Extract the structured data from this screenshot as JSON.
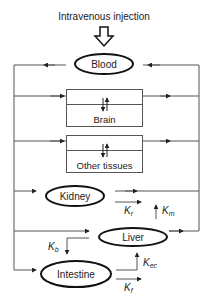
{
  "title": "Intravenous injection",
  "compartments": {
    "blood": "Blood",
    "brain": "Brain",
    "other_tissues": "Other tissues",
    "kidney": "Kidney",
    "liver": "Liver",
    "intestine": "Intestine"
  },
  "rate_constants": {
    "kr": {
      "base": "K",
      "sub": "r"
    },
    "km": {
      "base": "K",
      "sub": "m"
    },
    "kb": {
      "base": "K",
      "sub": "b"
    },
    "kec": {
      "base": "K",
      "sub": "ec"
    },
    "kf": {
      "base": "K",
      "sub": "f"
    }
  },
  "colors": {
    "line": "#555555",
    "ellipse": "#111111",
    "text": "#222222"
  }
}
